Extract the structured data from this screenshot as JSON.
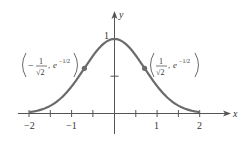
{
  "chart_data": {
    "type": "line",
    "title": "",
    "function": "y = e^(-x^2)",
    "xlabel": "x",
    "ylabel": "y",
    "xlim": [
      -2,
      2
    ],
    "ylim": [
      0,
      1
    ],
    "x_ticks": [
      -2,
      -1.5,
      -1,
      -0.5,
      0,
      0.5,
      1,
      1.5,
      2
    ],
    "x_tick_labels": [
      "-2",
      "-1",
      "1",
      "2"
    ],
    "y_tick_labels": [
      "1"
    ],
    "y_ticks": [
      0.5,
      1
    ],
    "grid": false,
    "series": [
      {
        "name": "e^(-x^2)",
        "x": [
          -2,
          -1.5,
          -1,
          -0.707,
          -0.5,
          0,
          0.5,
          0.707,
          1,
          1.5,
          2
        ],
        "y": [
          0.018,
          0.105,
          0.368,
          0.607,
          0.779,
          1,
          0.779,
          0.607,
          0.368,
          0.105,
          0.018
        ],
        "color": "#666666"
      }
    ],
    "annotations": [
      {
        "point": [
          -0.7071,
          0.6065
        ],
        "label": "(-1/√2, e^(-1/2))"
      },
      {
        "point": [
          0.7071,
          0.6065
        ],
        "label": "(1/√2, e^(-1/2))"
      }
    ]
  },
  "labels": {
    "x_axis": "x",
    "y_axis": "y",
    "tick_neg2": "−2",
    "tick_neg1": "−1",
    "tick_1": "1",
    "tick_2": "2",
    "y_tick_1": "1",
    "left_point": {
      "minus": "−",
      "num": "1",
      "den": "√2",
      "sep": ",",
      "e": "e",
      "exp": "−1/2"
    },
    "right_point": {
      "num": "1",
      "den": "√2",
      "sep": ",",
      "e": "e",
      "exp": "−1/2"
    }
  }
}
